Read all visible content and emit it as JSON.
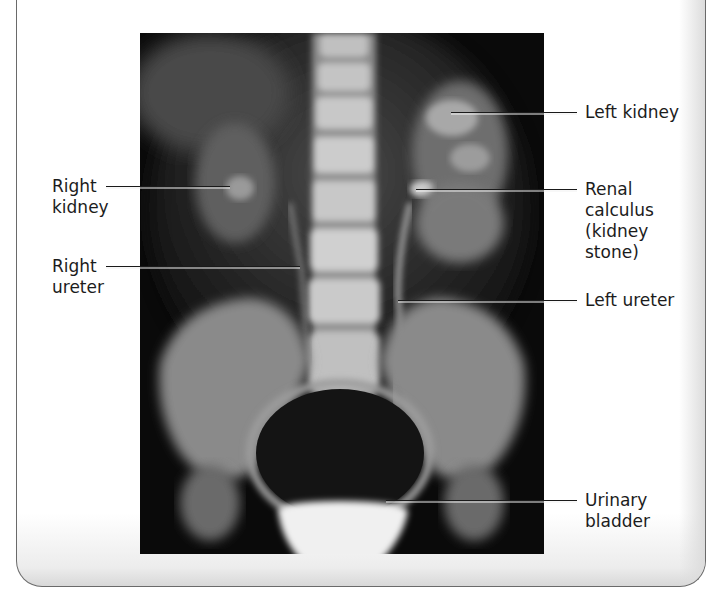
{
  "figure": {
    "type": "labeled radiograph (intravenous pyelogram)",
    "frame": {
      "border_color": "#6a6a6a",
      "background": "#ffffff"
    },
    "image": {
      "description": "X-ray of abdomen and pelvis showing urinary tract",
      "background": "#050505"
    },
    "labels": {
      "right_kidney": {
        "line1": "Right",
        "line2": "kidney"
      },
      "right_ureter": {
        "line1": "Right",
        "line2": "ureter"
      },
      "left_kidney": {
        "line1": "Left kidney"
      },
      "renal_calculus": {
        "line1": "Renal",
        "line2": "calculus",
        "line3": "(kidney",
        "line4": "stone)"
      },
      "left_ureter": {
        "line1": "Left ureter"
      },
      "urinary_bladder": {
        "line1": "Urinary",
        "line2": "bladder"
      }
    }
  }
}
